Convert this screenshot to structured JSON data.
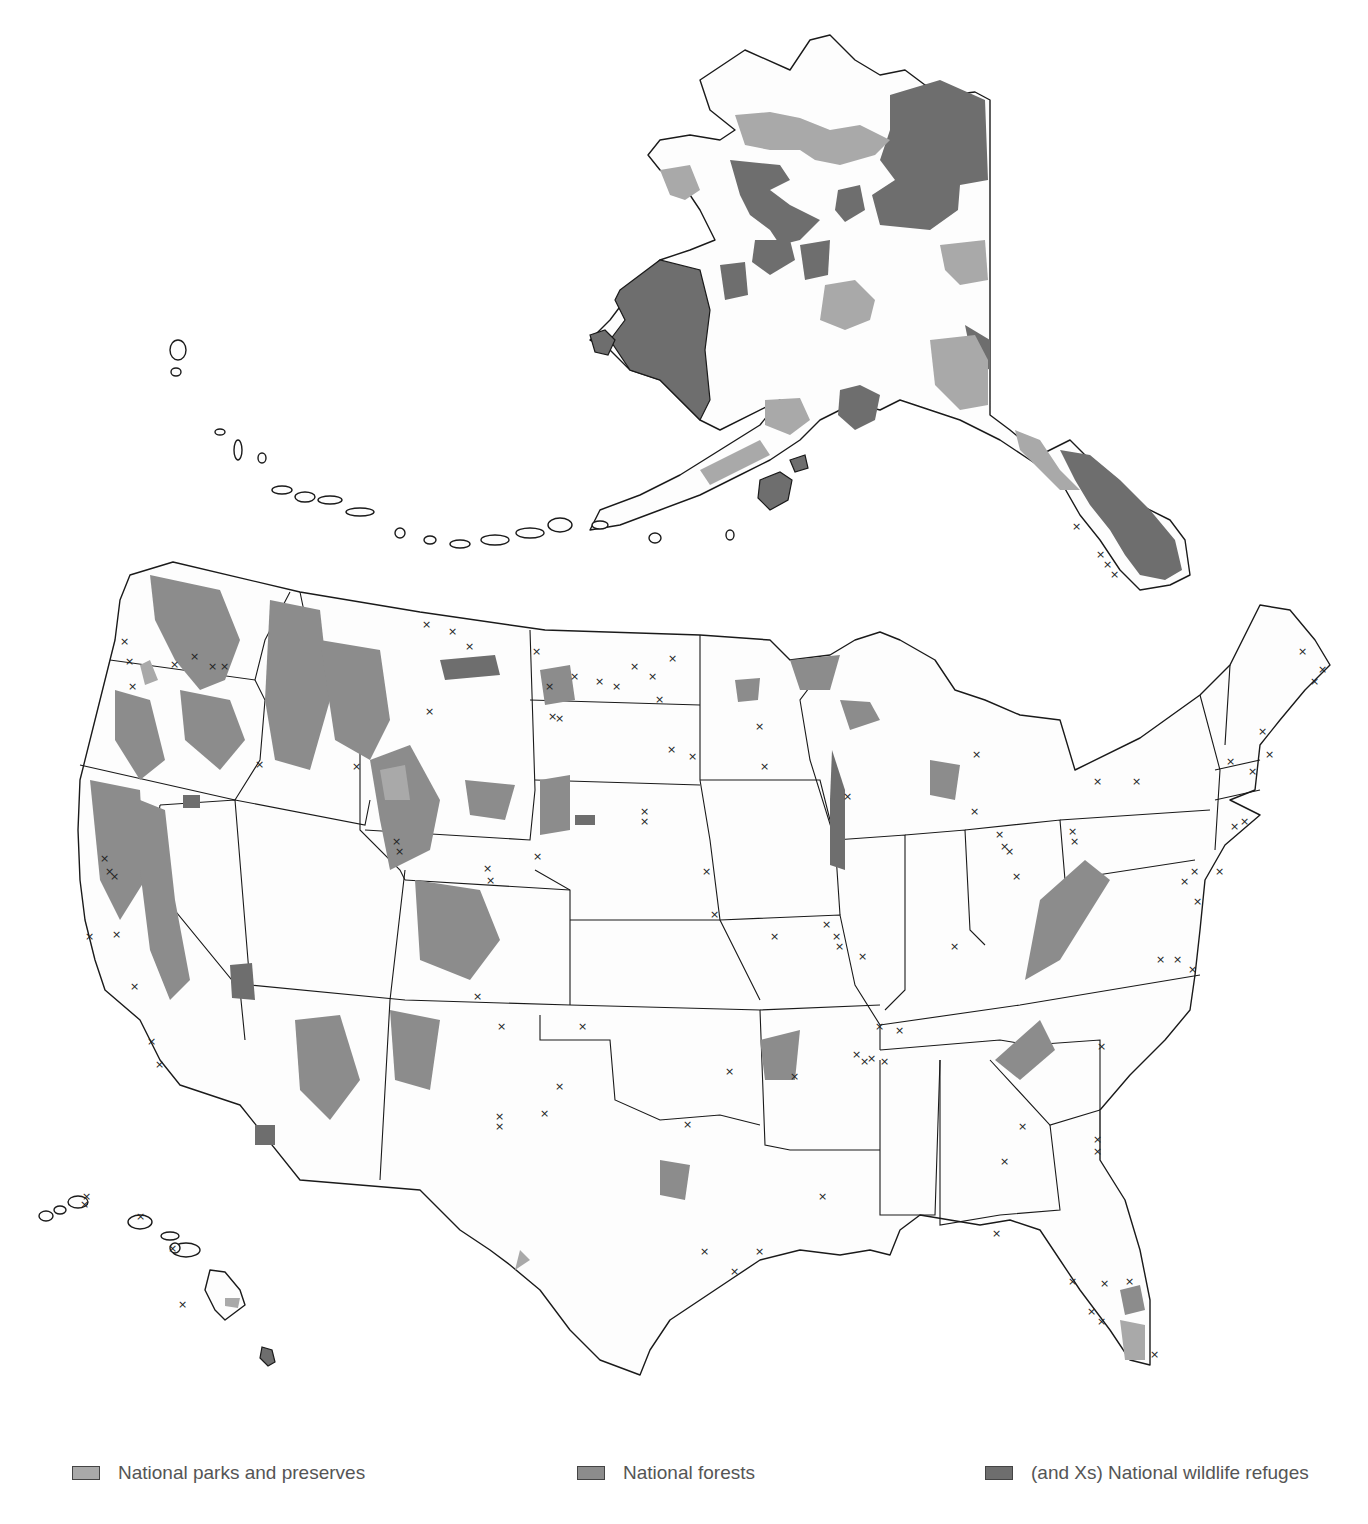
{
  "map": {
    "title": "",
    "regions": [
      "Alaska",
      "Contiguous United States",
      "Hawaii"
    ],
    "marker_symbol": "×"
  },
  "legend": {
    "items": [
      {
        "label": "National parks and preserves",
        "color": "#a9a9a9",
        "symbol": "park-swatch"
      },
      {
        "label": "National forests",
        "color": "#8c8c8c",
        "symbol": "forest-swatch"
      },
      {
        "label": "(and Xs) National wildlife refuges",
        "color": "#6e6e6e",
        "symbol": "refuge-swatch"
      }
    ]
  },
  "colors": {
    "land": "#fdfdfd",
    "outline": "#1a1a1a",
    "park": "#a9a9a9",
    "forest": "#8c8c8c",
    "refuge": "#6e6e6e"
  }
}
